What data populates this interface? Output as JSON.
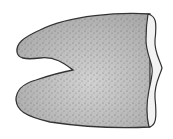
{
  "figure": {
    "colors": {
      "background": "#ffffff",
      "outline": "#333333",
      "fill_light": "#d6d6d6",
      "fill_dark": "#9a9a9a",
      "stipple": "#555555",
      "edge_band": "#f2f2f2"
    }
  }
}
